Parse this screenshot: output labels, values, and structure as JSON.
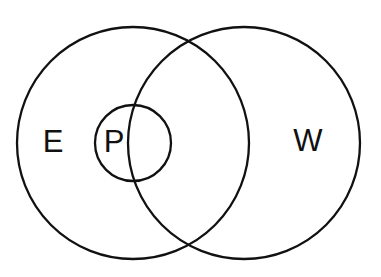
{
  "diagram": {
    "type": "venn",
    "stroke_color": "#111111",
    "background": "#ffffff",
    "sets": [
      {
        "id": "E",
        "label": "E",
        "cx": 133,
        "cy": 143,
        "r": 116,
        "label_x": 53,
        "label_y": 152
      },
      {
        "id": "W",
        "label": "W",
        "cx": 244,
        "cy": 143,
        "r": 116,
        "label_x": 308,
        "label_y": 151
      },
      {
        "id": "P",
        "label": "P",
        "cx": 133,
        "cy": 143,
        "r": 38,
        "label_x": 114,
        "label_y": 152
      }
    ]
  }
}
